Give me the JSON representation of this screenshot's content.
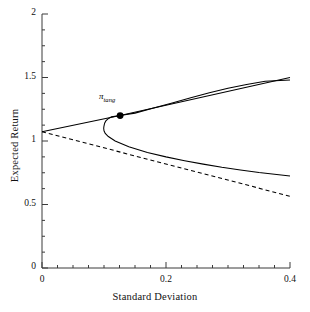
{
  "chart_data": {
    "type": "line",
    "title": "",
    "xlabel": "Standard Deviation",
    "ylabel": "Expected Return",
    "xlim": [
      0,
      0.4
    ],
    "ylim": [
      0,
      2
    ],
    "grid": false,
    "legend_position": "none",
    "xticks": [
      {
        "value": 0,
        "label": "0"
      },
      {
        "value": 0.2,
        "label": "0.2"
      },
      {
        "value": 0.4,
        "label": "0.4"
      }
    ],
    "yticks": [
      {
        "value": 0,
        "label": "0"
      },
      {
        "value": 0.5,
        "label": "0.5"
      },
      {
        "value": 1,
        "label": "1"
      },
      {
        "value": 1.5,
        "label": "1.5"
      },
      {
        "value": 2,
        "label": "2"
      }
    ],
    "x_minor_tick_step": 0.025,
    "y_minor_tick_step": 0.125,
    "annotations": [
      {
        "name": "tangency-portfolio",
        "text": "π",
        "subscript": "tang",
        "x": 0.126,
        "y": 1.2,
        "marker": "filled-circle"
      }
    ],
    "series": [
      {
        "name": "capital-market-line",
        "style": "solid",
        "color": "#000000",
        "points": [
          [
            0,
            1.073
          ],
          [
            0.126,
            1.2
          ],
          [
            0.4,
            1.5
          ]
        ]
      },
      {
        "name": "efficient-frontier-upper",
        "style": "solid",
        "color": "#000000",
        "points": [
          [
            0.1,
            1.12
          ],
          [
            0.101,
            1.14
          ],
          [
            0.103,
            1.158
          ],
          [
            0.106,
            1.172
          ],
          [
            0.112,
            1.19
          ],
          [
            0.126,
            1.2
          ],
          [
            0.15,
            1.2195
          ],
          [
            0.18,
            1.2598
          ],
          [
            0.21,
            1.3
          ],
          [
            0.24,
            1.34
          ],
          [
            0.27,
            1.38
          ],
          [
            0.3,
            1.415
          ],
          [
            0.33,
            1.445
          ],
          [
            0.36,
            1.47
          ],
          [
            0.4,
            1.48
          ]
        ]
      },
      {
        "name": "efficient-frontier-lower",
        "style": "solid",
        "color": "#000000",
        "points": [
          [
            0.1,
            1.12
          ],
          [
            0.0995,
            1.1
          ],
          [
            0.1,
            1.08
          ],
          [
            0.102,
            1.06
          ],
          [
            0.107,
            1.035
          ],
          [
            0.118,
            1.0
          ],
          [
            0.14,
            0.955
          ],
          [
            0.17,
            0.91
          ],
          [
            0.2,
            0.875
          ],
          [
            0.23,
            0.845
          ],
          [
            0.26,
            0.818
          ],
          [
            0.29,
            0.793
          ],
          [
            0.32,
            0.772
          ],
          [
            0.35,
            0.752
          ],
          [
            0.4,
            0.725
          ]
        ]
      },
      {
        "name": "inefficient-risk-free-line",
        "style": "dashed",
        "color": "#000000",
        "points": [
          [
            0,
            1.073
          ],
          [
            0.4,
            0.565
          ]
        ]
      }
    ]
  }
}
